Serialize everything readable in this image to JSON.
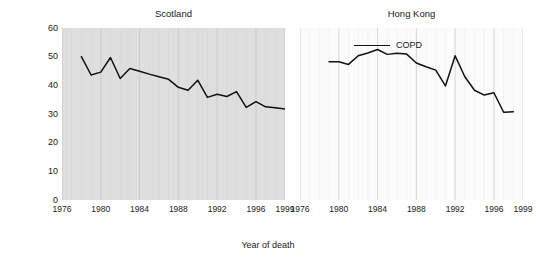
{
  "chart_data": {
    "type": "line",
    "title": "",
    "xlabel": "Year of death",
    "ylabel": "Rate per 100,000",
    "ylim": [
      0,
      60
    ],
    "xlim": [
      1976,
      1999
    ],
    "yticks": [
      0,
      10,
      20,
      30,
      40,
      50,
      60
    ],
    "xticks": [
      1976,
      1980,
      1984,
      1988,
      1992,
      1996,
      1999
    ],
    "grid": "vertical",
    "legend": {
      "position": "top-center-right-panel",
      "entries": [
        {
          "label": "COPD",
          "color": "#111111"
        }
      ]
    },
    "panels": [
      {
        "name": "scotland",
        "title": "Scotland",
        "background": "#dedede",
        "series": [
          {
            "name": "COPD",
            "color": "#111111",
            "x": [
              1978,
              1979,
              1980,
              1981,
              1982,
              1983,
              1984,
              1985,
              1986,
              1987,
              1988,
              1989,
              1990,
              1991,
              1992,
              1993,
              1994,
              1995,
              1996,
              1997,
              1998,
              1999
            ],
            "values": [
              50.0,
              43.6,
              44.6,
              49.7,
              42.4,
              45.9,
              44.9,
              43.9,
              43.0,
              42.1,
              39.3,
              38.3,
              41.8,
              35.8,
              36.9,
              36.1,
              37.8,
              32.3,
              34.3,
              32.5,
              32.2,
              31.7
            ]
          }
        ]
      },
      {
        "name": "hongkong",
        "title": "Hong Kong",
        "background": "#fbfbfb",
        "series": [
          {
            "name": "COPD",
            "color": "#111111",
            "x": [
              1979,
              1980,
              1981,
              1982,
              1983,
              1984,
              1985,
              1986,
              1987,
              1988,
              1989,
              1990,
              1991,
              1992,
              1993,
              1994,
              1995,
              1996,
              1997,
              1998
            ],
            "values": [
              48.2,
              48.2,
              47.3,
              50.3,
              51.3,
              52.5,
              50.8,
              51.2,
              50.9,
              47.8,
              46.5,
              45.3,
              39.8,
              50.3,
              43.0,
              38.3,
              36.6,
              37.4,
              30.6,
              30.8
            ]
          }
        ]
      }
    ]
  },
  "axis": {
    "ylabel": "Rate per 100,000",
    "xlabel": "Year of death",
    "ytick_labels": [
      "60",
      "50",
      "40",
      "30",
      "20",
      "10",
      "0"
    ],
    "xtick_labels": [
      "1976",
      "1980",
      "1984",
      "1988",
      "1992",
      "1996",
      "1999"
    ]
  },
  "panels": {
    "scotland": {
      "title": "Scotland"
    },
    "hongkong": {
      "title": "Hong Kong"
    }
  },
  "legend": {
    "label": "COPD"
  },
  "colors": {
    "line": "#111111",
    "scotland_bg": "#dedede",
    "hongkong_bg": "#fbfbfb",
    "gridline": "#c9c9c9",
    "text": "#1a1a1a"
  }
}
